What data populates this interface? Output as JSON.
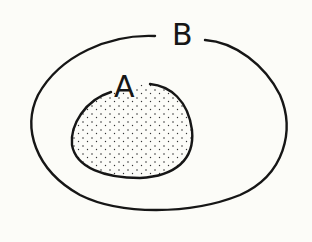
{
  "diagram": {
    "type": "venn",
    "sets": [
      {
        "id": "B",
        "label": "B",
        "shaded": false
      },
      {
        "id": "A",
        "label": "A",
        "shaded": true,
        "contained_in": "B"
      }
    ],
    "colors": {
      "background": "#fcfcf8",
      "stroke": "#161616"
    }
  }
}
